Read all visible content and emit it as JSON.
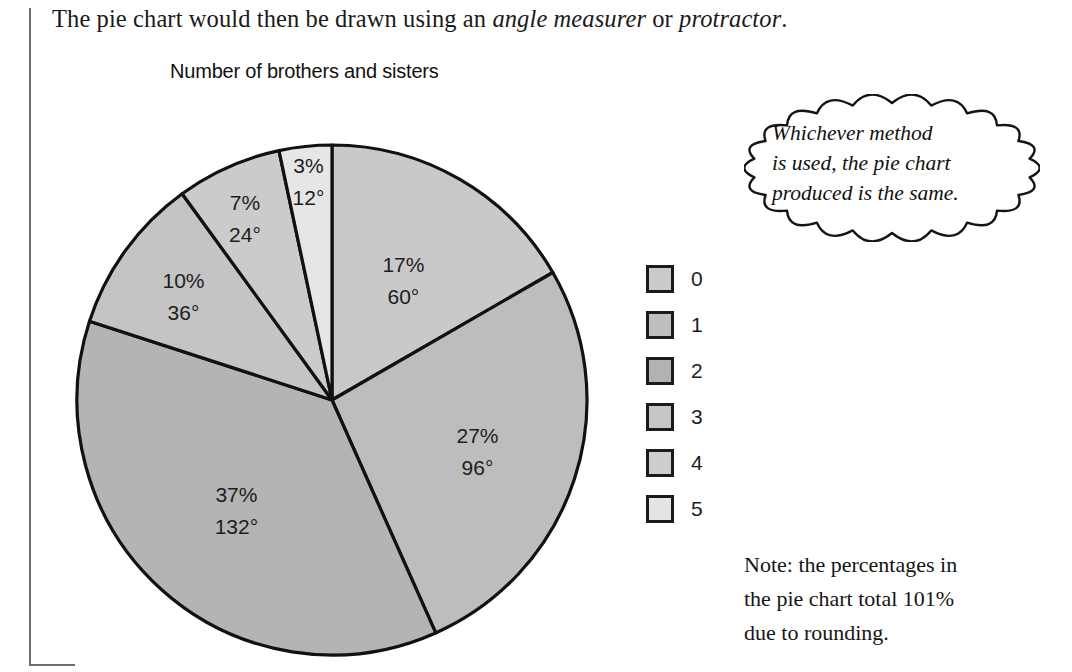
{
  "intro": {
    "before": "The pie chart would then be drawn using an ",
    "italic1": "angle measurer",
    "middle": " or ",
    "italic2": "protractor",
    "after": "."
  },
  "chart_data": {
    "type": "pie",
    "title": "Number of brothers and sisters",
    "legend_position": "right",
    "start_angle_deg": 0,
    "direction": "clockwise",
    "categories": [
      "0",
      "1",
      "2",
      "3",
      "4",
      "5"
    ],
    "values": [
      17,
      27,
      37,
      10,
      7,
      3
    ],
    "angles": [
      60,
      96,
      132,
      36,
      24,
      12
    ],
    "colors": [
      "#c9c9c9",
      "#bdbdbd",
      "#b4b4b4",
      "#c4c4c4",
      "#cbcbcb",
      "#e6e6e6"
    ],
    "slices": [
      {
        "label": "0",
        "percent": "17%",
        "angle": "60°",
        "value": 17,
        "angle_deg": 60,
        "color": "#c9c9c9"
      },
      {
        "label": "1",
        "percent": "27%",
        "angle": "96°",
        "value": 27,
        "angle_deg": 96,
        "color": "#bdbdbd"
      },
      {
        "label": "2",
        "percent": "37%",
        "angle": "132°",
        "value": 37,
        "angle_deg": 132,
        "color": "#b4b4b4"
      },
      {
        "label": "3",
        "percent": "10%",
        "angle": "36°",
        "value": 10,
        "angle_deg": 36,
        "color": "#c4c4c4"
      },
      {
        "label": "4",
        "percent": "7%",
        "angle": "24°",
        "value": 7,
        "angle_deg": 24,
        "color": "#cbcbcb"
      },
      {
        "label": "5",
        "percent": "3%",
        "angle": "12°",
        "value": 3,
        "angle_deg": 12,
        "color": "#e6e6e6"
      }
    ],
    "total_percent": "101%",
    "stroke_color": "#111111"
  },
  "legend": {
    "items": [
      {
        "label": "0",
        "color": "#cacaca"
      },
      {
        "label": "1",
        "color": "#bebebe"
      },
      {
        "label": "2",
        "color": "#b2b2b2"
      },
      {
        "label": "3",
        "color": "#c6c6c6"
      },
      {
        "label": "4",
        "color": "#cdcdcd"
      },
      {
        "label": "5",
        "color": "#e4e4e4"
      }
    ]
  },
  "bubble": {
    "line1": "Whichever method",
    "line2": "is used, the pie chart",
    "line3": "produced is the same."
  },
  "note": {
    "line1": "Note: the percentages in",
    "line2": "the pie chart total 101%",
    "line3": "due to rounding."
  }
}
